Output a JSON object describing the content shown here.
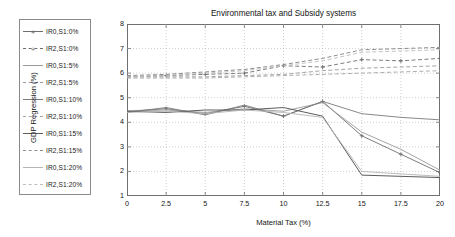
{
  "chart_data": {
    "type": "line",
    "title": "Environmental tax and Subsidy systems",
    "xlabel": "Material Tax (%)",
    "ylabel": "GDP Regression (%)",
    "xlim": [
      0,
      20
    ],
    "ylim": [
      1,
      8
    ],
    "xticks": [
      "0",
      "2.5",
      "5",
      "7.5",
      "10",
      "12.5",
      "15",
      "17.5",
      "20"
    ],
    "xtick_values": [
      0,
      2.5,
      5,
      7.5,
      10,
      12.5,
      15,
      17.5,
      20
    ],
    "yticks": [
      "1",
      "2",
      "3",
      "4",
      "5",
      "6",
      "7",
      "8"
    ],
    "ytick_values": [
      1,
      2,
      3,
      4,
      5,
      6,
      7,
      8
    ],
    "grid": true,
    "grid_style": "dotted",
    "legend_position": "outside-left",
    "x": [
      0,
      2.5,
      5,
      7.5,
      10,
      12.5,
      15,
      17.5,
      20
    ],
    "series": [
      {
        "name": "IR0,S1:0%",
        "label": "IR0,S1:0%",
        "style": "solid",
        "marker": "plus",
        "color": "#6e6e6e",
        "width": 0.9,
        "values": [
          4.45,
          4.55,
          4.35,
          4.65,
          4.25,
          4.85,
          3.45,
          2.7,
          1.95
        ]
      },
      {
        "name": "IR2,S1:0%",
        "label": "IR2,S1:0%",
        "style": "dashed",
        "marker": "plus",
        "color": "#6e6e6e",
        "width": 0.9,
        "values": [
          5.85,
          5.9,
          5.95,
          6.0,
          6.3,
          6.25,
          6.55,
          6.5,
          6.6
        ]
      },
      {
        "name": "IR0,S1:5%",
        "label": "IR0,S1:5%",
        "style": "solid",
        "marker": "none",
        "color": "#9a9a9a",
        "width": 0.9,
        "values": [
          4.45,
          4.5,
          4.4,
          4.55,
          4.45,
          4.8,
          3.6,
          2.9,
          2.05
        ]
      },
      {
        "name": "IR2,S1:5%",
        "label": "IR2,S1:5%",
        "style": "dashed",
        "marker": "none",
        "color": "#9a9a9a",
        "width": 0.9,
        "values": [
          5.85,
          5.85,
          5.85,
          5.9,
          5.95,
          6.1,
          6.2,
          6.25,
          6.3
        ]
      },
      {
        "name": "IR0,S1:10%",
        "label": "IR0,S1:10%",
        "style": "solid",
        "marker": "none",
        "color": "#7b7b7b",
        "width": 0.9,
        "values": [
          4.4,
          4.6,
          4.3,
          4.7,
          4.25,
          4.85,
          4.35,
          4.2,
          4.1
        ]
      },
      {
        "name": "IR2,S1:10%",
        "label": "IR2,S1:10%",
        "style": "dashed",
        "marker": "none",
        "color": "#a5a5a5",
        "width": 0.9,
        "values": [
          5.8,
          5.8,
          5.8,
          5.85,
          5.9,
          5.95,
          6.0,
          6.05,
          6.1
        ]
      },
      {
        "name": "IR0,S1:15%",
        "label": "IR0,S1:15%",
        "style": "solid",
        "marker": "none",
        "color": "#5c5c5c",
        "width": 1.0,
        "values": [
          4.45,
          4.4,
          4.5,
          4.5,
          4.6,
          4.25,
          1.85,
          1.8,
          1.75
        ]
      },
      {
        "name": "IR2,S1:15%",
        "label": "IR2,S1:15%",
        "style": "dashed",
        "marker": "none",
        "color": "#8d8d8d",
        "width": 1.0,
        "values": [
          5.9,
          5.95,
          6.05,
          6.15,
          6.35,
          6.6,
          6.95,
          7.0,
          7.05
        ]
      },
      {
        "name": "IR0,S1:20%",
        "label": "IR0,S1:20%",
        "style": "solid",
        "marker": "none",
        "color": "#b4b4b4",
        "width": 0.9,
        "values": [
          4.4,
          4.45,
          4.35,
          4.5,
          4.4,
          4.2,
          2.0,
          1.9,
          1.8
        ]
      },
      {
        "name": "IR2,S1:20%",
        "label": "IR2,S1:20%",
        "style": "dashed",
        "marker": "none",
        "color": "#bdbdbd",
        "width": 0.9,
        "values": [
          5.85,
          5.9,
          6.0,
          6.1,
          6.3,
          6.5,
          6.85,
          6.9,
          6.95
        ]
      }
    ]
  },
  "colors": {
    "frame": "#6f6f6f",
    "grid": "#b9b9b9",
    "legend_border": "#8a8a8a",
    "background": "#ffffff",
    "text": "#141414"
  }
}
